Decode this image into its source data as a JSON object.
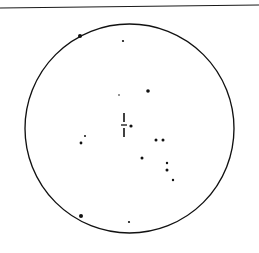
{
  "figure": {
    "width": 259,
    "height": 253,
    "background_color": "#ffffff",
    "ink_color": "#111111"
  },
  "top_rule": {
    "label": "horizontal separator rule",
    "x1": 0,
    "y1": 8,
    "x2": 259,
    "y2": 5,
    "stroke_color": "#1a1a1a",
    "stroke_width": 1.1
  },
  "field_circle": {
    "label": "field of view boundary",
    "cx": 129.5,
    "cy": 128.5,
    "r": 104.5,
    "stroke_color": "#111111",
    "stroke_width": 1.35,
    "fill": "none"
  },
  "center_marker": {
    "label": "dashed crosshair position marker",
    "stroke_color": "#111111",
    "segments": [
      {
        "name": "vertical-upper-dash",
        "x1": 124,
        "y1": 113,
        "x2": 124,
        "y2": 122,
        "width": 1.6
      },
      {
        "name": "vertical-lower-dash",
        "x1": 124,
        "y1": 128,
        "x2": 124,
        "y2": 137,
        "width": 1.6
      },
      {
        "name": "horizontal-tick",
        "x1": 121,
        "y1": 125,
        "x2": 127,
        "y2": 125,
        "width": 1.3
      }
    ]
  },
  "stars": [
    {
      "name": "star-upper-left-bright",
      "x": 80,
      "y": 36,
      "r": 2.0
    },
    {
      "name": "star-upper-mid-faint",
      "x": 123,
      "y": 41,
      "r": 1.1
    },
    {
      "name": "star-upper-center-faint",
      "x": 119,
      "y": 95,
      "r": 0.8
    },
    {
      "name": "star-upper-right-mid",
      "x": 148,
      "y": 91,
      "r": 1.8
    },
    {
      "name": "star-center-right-dot",
      "x": 131,
      "y": 126,
      "r": 1.6
    },
    {
      "name": "star-left-mid-faint",
      "x": 85,
      "y": 136,
      "r": 1.0
    },
    {
      "name": "star-left-mid",
      "x": 81,
      "y": 143,
      "r": 1.4
    },
    {
      "name": "star-right-pair-left",
      "x": 156,
      "y": 140,
      "r": 1.5
    },
    {
      "name": "star-right-pair-right",
      "x": 163,
      "y": 140,
      "r": 1.5
    },
    {
      "name": "star-lower-center",
      "x": 142,
      "y": 158,
      "r": 1.5
    },
    {
      "name": "star-lower-right-upper",
      "x": 167,
      "y": 163,
      "r": 1.2
    },
    {
      "name": "star-lower-right-lower",
      "x": 167,
      "y": 170,
      "r": 1.5
    },
    {
      "name": "star-lower-right-faint",
      "x": 173,
      "y": 180,
      "r": 1.2
    },
    {
      "name": "star-bottom-left-bright",
      "x": 81,
      "y": 216,
      "r": 2.0
    },
    {
      "name": "star-bottom-center-faint",
      "x": 129,
      "y": 222,
      "r": 1.1
    }
  ]
}
